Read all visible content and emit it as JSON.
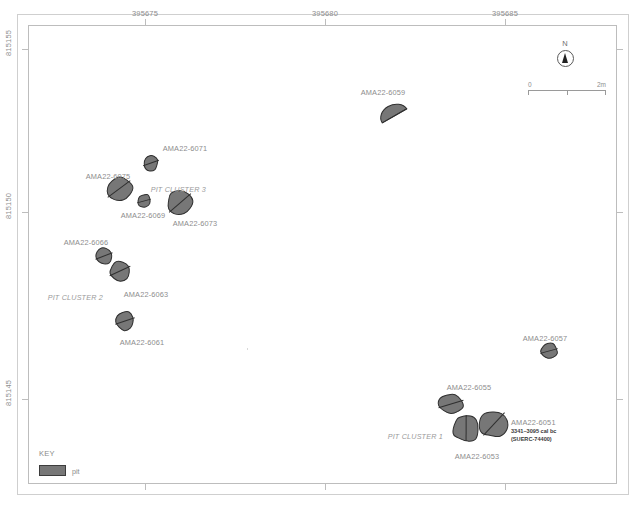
{
  "map": {
    "title": "Archaeological pit distribution plan",
    "x_axis": {
      "labels": [
        "395675",
        "395680",
        "395685"
      ],
      "tick_x": [
        145,
        325,
        505
      ]
    },
    "y_axis": {
      "labels": [
        "815155",
        "815150",
        "815145"
      ],
      "tick_y": [
        49,
        212,
        399
      ]
    },
    "north": {
      "letter": "N",
      "icon": "north-arrow-icon"
    },
    "scale": {
      "start_label": "0",
      "end_label": "2m",
      "units": "m",
      "length_m": 2
    },
    "key": {
      "title": "KEY",
      "entries": [
        {
          "label": "pit",
          "color": "#777777"
        }
      ]
    },
    "clusters": [
      {
        "id": "pit-cluster-3",
        "label": "PIT CLUSTER 3",
        "x": 206,
        "y": 185,
        "align": "right"
      },
      {
        "id": "pit-cluster-2",
        "label": "PIT CLUSTER 2",
        "x": 103,
        "y": 293,
        "align": "right"
      },
      {
        "id": "pit-cluster-1",
        "label": "PIT CLUSTER 1",
        "x": 443,
        "y": 432,
        "align": "right"
      }
    ],
    "pits": [
      {
        "id": "AMA22-6059",
        "label": "AMA22-6059",
        "shape": "dshape",
        "cx": 393,
        "cy": 112,
        "rx": 14,
        "ry": 11,
        "rot": -22,
        "label_x": 383,
        "label_y": 88,
        "label_align": "center"
      },
      {
        "id": "AMA22-6071",
        "label": "AMA22-6071",
        "shape": "oval",
        "cx": 151,
        "cy": 163,
        "rx": 7,
        "ry": 8,
        "rot": 18,
        "label_x": 185,
        "label_y": 144,
        "label_align": "center"
      },
      {
        "id": "AMA22-6075",
        "label": "AMA22-6075",
        "shape": "oval",
        "cx": 119,
        "cy": 189,
        "rx": 13,
        "ry": 11,
        "rot": -8,
        "label_x": 108,
        "label_y": 172,
        "label_align": "center"
      },
      {
        "id": "AMA22-6069",
        "label": "AMA22-6069",
        "shape": "oval",
        "cx": 144,
        "cy": 201,
        "rx": 6,
        "ry": 7,
        "rot": 22,
        "label_x": 143,
        "label_y": 211,
        "label_align": "center"
      },
      {
        "id": "AMA22-6073",
        "label": "AMA22-6073",
        "shape": "oval",
        "cx": 180,
        "cy": 203,
        "rx": 13,
        "ry": 12,
        "rot": -10,
        "label_x": 195,
        "label_y": 219,
        "label_align": "center"
      },
      {
        "id": "AMA22-6066",
        "label": "AMA22-6066",
        "shape": "oval",
        "cx": 104,
        "cy": 256,
        "rx": 8,
        "ry": 8,
        "rot": 12,
        "label_x": 86,
        "label_y": 238,
        "label_align": "center"
      },
      {
        "id": "AMA22-6063",
        "label": "AMA22-6063",
        "shape": "oval",
        "cx": 120,
        "cy": 271,
        "rx": 10,
        "ry": 10,
        "rot": 8,
        "label_x": 146,
        "label_y": 290,
        "label_align": "center"
      },
      {
        "id": "AMA22-6061",
        "label": "AMA22-6061",
        "shape": "oval",
        "cx": 125,
        "cy": 321,
        "rx": 9,
        "ry": 9,
        "rot": 14,
        "label_x": 142,
        "label_y": 338,
        "label_align": "center"
      },
      {
        "id": "AMA22-6057",
        "label": "AMA22-6057",
        "shape": "oval",
        "cx": 549,
        "cy": 351,
        "rx": 8,
        "ry": 8,
        "rot": 18,
        "label_x": 545,
        "label_y": 334,
        "label_align": "center"
      },
      {
        "id": "AMA22-6055",
        "label": "AMA22-6055",
        "shape": "oval",
        "cx": 451,
        "cy": 404,
        "rx": 12,
        "ry": 10,
        "rot": 12,
        "label_x": 469,
        "label_y": 383,
        "label_align": "center"
      },
      {
        "id": "AMA22-6053",
        "label": "AMA22-6053",
        "shape": "squarish",
        "cx": 466,
        "cy": 428,
        "rx": 12,
        "ry": 13,
        "rot": 6,
        "label_x": 477,
        "label_y": 452,
        "label_align": "center"
      },
      {
        "id": "AMA22-6051",
        "label": "AMA22-6051",
        "shape": "oval",
        "cx": 494,
        "cy": 424,
        "rx": 14,
        "ry": 13,
        "rot": -16,
        "label_x": 511,
        "label_y": 418,
        "label_align": "left",
        "date_line_1": "3341–3095 cal bc",
        "date_line_2": "(SUERC-74400)"
      }
    ]
  }
}
